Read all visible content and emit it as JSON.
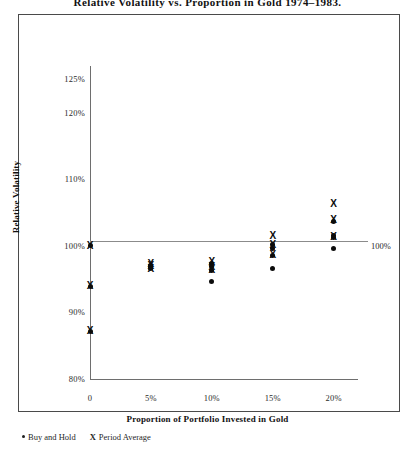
{
  "chart_data": {
    "type": "scatter",
    "title": "Relative Volatility vs. Proportion in Gold 1974–1983.",
    "xlabel": "Proportion of Portfolio Invested in Gold",
    "ylabel": "Relative Volatility",
    "xlim": [
      0,
      22
    ],
    "ylim": [
      80,
      127
    ],
    "grid": false,
    "legend_position": "below-plot-left",
    "xticks": [
      {
        "value": 0,
        "label": "0"
      },
      {
        "value": 5,
        "label": "5%"
      },
      {
        "value": 10,
        "label": "10%"
      },
      {
        "value": 15,
        "label": "15%"
      },
      {
        "value": 20,
        "label": "20%"
      }
    ],
    "yticks": [
      {
        "value": 125,
        "label": "125%"
      },
      {
        "value": 120,
        "label": "120%"
      },
      {
        "value": 110,
        "label": "110%"
      },
      {
        "value": 100,
        "label": "100%"
      },
      {
        "value": 90,
        "label": "90%"
      },
      {
        "value": 80,
        "label": "80%"
      }
    ],
    "annotations": [
      {
        "text": "100%",
        "x": 20.9,
        "y": 100
      }
    ],
    "reference_lines": [
      {
        "orientation": "horizontal",
        "y": 100
      }
    ],
    "series": [
      {
        "name": "Buy and Hold",
        "marker": "dot",
        "points": [
          {
            "x": 0,
            "y": 100.0
          },
          {
            "x": 0,
            "y": 93.9
          },
          {
            "x": 0,
            "y": 87.2
          },
          {
            "x": 5,
            "y": 97.1
          },
          {
            "x": 5,
            "y": 96.8
          },
          {
            "x": 5,
            "y": 96.6
          },
          {
            "x": 10,
            "y": 97.4
          },
          {
            "x": 10,
            "y": 96.9
          },
          {
            "x": 10,
            "y": 96.3
          },
          {
            "x": 10,
            "y": 94.6
          },
          {
            "x": 15,
            "y": 100.2
          },
          {
            "x": 15,
            "y": 99.6
          },
          {
            "x": 15,
            "y": 98.6
          },
          {
            "x": 15,
            "y": 96.6
          },
          {
            "x": 20,
            "y": 103.7
          },
          {
            "x": 20,
            "y": 101.6
          },
          {
            "x": 20,
            "y": 101.3
          },
          {
            "x": 20,
            "y": 99.6
          }
        ]
      },
      {
        "name": "Period Average",
        "marker": "x",
        "points": [
          {
            "x": 0,
            "y": 100.0
          },
          {
            "x": 0,
            "y": 93.9
          },
          {
            "x": 0,
            "y": 87.2
          },
          {
            "x": 5,
            "y": 97.3
          },
          {
            "x": 5,
            "y": 96.9
          },
          {
            "x": 5,
            "y": 96.5
          },
          {
            "x": 10,
            "y": 97.6
          },
          {
            "x": 10,
            "y": 96.8
          },
          {
            "x": 10,
            "y": 96.4
          },
          {
            "x": 15,
            "y": 101.4
          },
          {
            "x": 15,
            "y": 100.1
          },
          {
            "x": 15,
            "y": 98.6
          },
          {
            "x": 20,
            "y": 106.3
          },
          {
            "x": 20,
            "y": 103.9
          },
          {
            "x": 20,
            "y": 101.3
          }
        ]
      }
    ]
  },
  "legend": {
    "items": [
      {
        "glyph": "•",
        "label": "Buy and Hold",
        "marker": "dot"
      },
      {
        "glyph": "X",
        "label": "Period Average",
        "marker": "x"
      }
    ]
  }
}
